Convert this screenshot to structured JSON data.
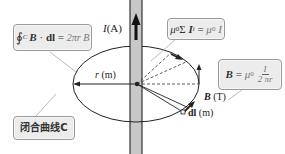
{
  "diagram": {
    "topic": "Ampère's circuital law around a straight current-carrying wire",
    "wire": {
      "current_label_symbol": "I",
      "current_label_unit": "(A)",
      "direction": "up"
    },
    "closed_curve": {
      "label": "闭合曲线C"
    },
    "radius": {
      "symbol": "r",
      "unit": "(m)"
    },
    "field": {
      "symbol": "B",
      "unit": "(T)"
    },
    "line_element": {
      "symbol": "dl",
      "unit": "(m)"
    },
    "formulas": {
      "line_integral": {
        "integral_sign": "∮",
        "subscript": "C",
        "lhs_b": "B",
        "dot": " · ",
        "lhs_dl": "dl",
        "equals": " = ",
        "rhs": "2πr B"
      },
      "enclosed_current": {
        "mu": "μ",
        "mu_sub": "0",
        "sigma": "Σ",
        "i": " I",
        "i_sub": "i",
        "equals": " = ",
        "rhs": "μ",
        "rhs_sub": "0",
        "rhs_i": " I"
      },
      "field_result": {
        "lhs": "B",
        "equals": " = ",
        "mu": "μ",
        "mu_sub": "0",
        "numerator": "I",
        "denominator": "2 πr"
      }
    },
    "colors": {
      "wire_fill": "#c8c8c8",
      "wire_border": "#333333",
      "box_fill": "#ececec",
      "box_border": "#9a9a9a",
      "line": "#222222",
      "leader_line": "#aaaaaa"
    }
  }
}
